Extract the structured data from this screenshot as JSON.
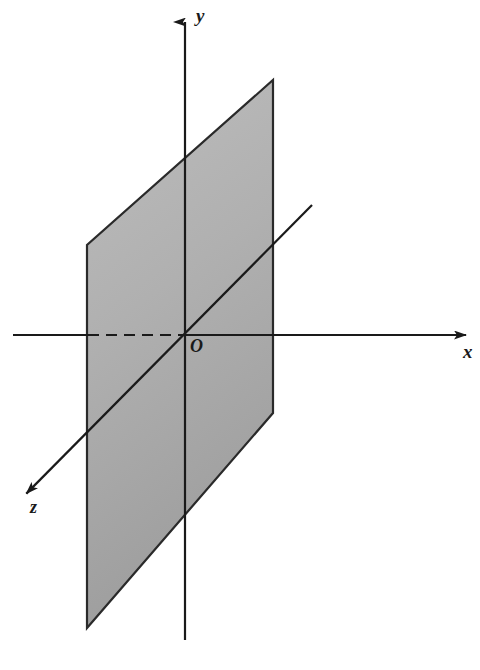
{
  "figure": {
    "background_color": "#ffffff",
    "line_color": "#1a1a1a",
    "plane_fill_top": "#b3b3b3",
    "plane_fill_bottom": "#a0a0a0",
    "plane_stroke": "#2a2a2a"
  },
  "labels": {
    "y_axis": "y",
    "x_axis": "x",
    "z_axis": "z",
    "origin": "O"
  },
  "icons": {
    "y_arrow": "arrow-up-icon",
    "x_arrow": "arrow-right-icon",
    "z_arrow": "arrow-down-left-icon"
  },
  "geometry": {
    "origin": {
      "x": 185,
      "y": 335
    },
    "y_axis": {
      "from": {
        "x": 185,
        "y": 640
      },
      "to": {
        "x": 185,
        "y": 12
      },
      "arrow": "up"
    },
    "x_axis": {
      "from": {
        "x": 13,
        "y": 335
      },
      "to": {
        "x": 472,
        "y": 335
      },
      "arrow": "right"
    },
    "z_axis": {
      "from": {
        "x": 312,
        "y": 205
      },
      "to": {
        "x": 20,
        "y": 500
      },
      "arrow": "down-left"
    },
    "x_axis_hidden_segment": {
      "from": {
        "x": 87,
        "y": 335
      },
      "to": {
        "x": 185,
        "y": 335
      },
      "style": "dashed"
    },
    "plane_corners": [
      {
        "x": 273,
        "y": 80
      },
      {
        "x": 273,
        "y": 413
      },
      {
        "x": 87,
        "y": 628
      },
      {
        "x": 87,
        "y": 245
      }
    ]
  },
  "chart_data": {
    "type": "diagram",
    "elements": [
      {
        "name": "y-axis",
        "kind": "axis",
        "label": "y",
        "direction": "vertical-up"
      },
      {
        "name": "x-axis",
        "kind": "axis",
        "label": "x",
        "direction": "horizontal-right"
      },
      {
        "name": "z-axis",
        "kind": "axis",
        "label": "z",
        "direction": "diagonal-down-left"
      },
      {
        "name": "origin",
        "kind": "point",
        "label": "O"
      },
      {
        "name": "plane",
        "kind": "parallelogram",
        "label": "",
        "shaded": true
      }
    ]
  }
}
